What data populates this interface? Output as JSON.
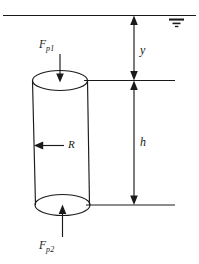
{
  "figure": {
    "type": "engineering-free-body-diagram",
    "labels": {
      "force_top_symbol": "F",
      "force_top_subscript": "p1",
      "force_bottom_symbol": "F",
      "force_bottom_subscript": "p2",
      "depth_to_top": "y",
      "cylinder_height": "h",
      "radius": "R"
    },
    "elements": {
      "free_surface_line": "water-surface-line",
      "free_surface_symbol": "water-level-symbol",
      "cylinder": "submerged-cylinder",
      "top_face": "cylinder-top-ellipse",
      "bottom_face": "cylinder-bottom-ellipse",
      "force_arrow_top": "downward-pressure-force-arrow",
      "force_arrow_bottom": "upward-pressure-force-arrow",
      "radius_arrow": "radius-indicator-arrow",
      "dimension_y": "depth-dimension-line",
      "dimension_h": "height-dimension-line"
    },
    "colors": {
      "stroke": "#1a1a1a",
      "background": "#ffffff"
    }
  }
}
